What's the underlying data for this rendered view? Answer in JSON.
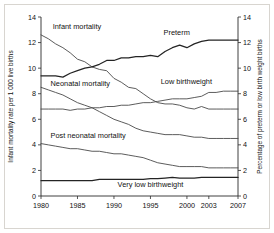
{
  "chart_data": {
    "type": "line",
    "title": "",
    "xlabel": "",
    "ylabel": "Infant mortality rate per 1 000 live births",
    "y2label": "Percentage of preterm or low birth weight births",
    "xlim": [
      1980,
      2007
    ],
    "ylim": [
      0,
      14
    ],
    "y2lim": [
      0,
      14
    ],
    "grid": false,
    "legend_position": "inline-annotations",
    "xticks": [
      "1980",
      "1985",
      "1990",
      "1995",
      "2000",
      "2003",
      "2007"
    ],
    "xtick_values": [
      1980,
      1985,
      1990,
      1995,
      2000,
      2003,
      2007
    ],
    "yticks": [
      "0",
      "2",
      "4",
      "6",
      "8",
      "10",
      "12",
      "14"
    ],
    "ytick_values": [
      0,
      2,
      4,
      6,
      8,
      10,
      12,
      14
    ],
    "y2ticks": [
      "0",
      "2",
      "4",
      "6",
      "8",
      "10",
      "12",
      "14"
    ],
    "y2tick_values": [
      0,
      2,
      4,
      6,
      8,
      10,
      12,
      14
    ],
    "x": [
      1980,
      1981,
      1982,
      1983,
      1984,
      1985,
      1986,
      1987,
      1988,
      1989,
      1990,
      1991,
      1992,
      1993,
      1994,
      1995,
      1996,
      1997,
      1998,
      1999,
      2000,
      2001,
      2002,
      2003,
      2004,
      2005,
      2006,
      2007
    ],
    "series": [
      {
        "name": "Infant mortality",
        "axis": "left",
        "label": "Infant mortality",
        "color": "#4a4a4a",
        "values": [
          12.6,
          12.3,
          11.9,
          11.6,
          11.2,
          10.7,
          10.5,
          10.1,
          9.9,
          9.8,
          9.2,
          8.9,
          8.5,
          8.4,
          8.0,
          7.6,
          7.3,
          7.2,
          7.2,
          7.1,
          6.9,
          6.8,
          7.0,
          6.8,
          6.8,
          6.8,
          6.8,
          6.8
        ]
      },
      {
        "name": "Neonatal mortality",
        "axis": "left",
        "label": "Neonatal mortality",
        "color": "#4a4a4a",
        "values": [
          8.5,
          8.3,
          8.1,
          7.9,
          7.6,
          7.3,
          7.1,
          6.9,
          6.6,
          6.3,
          6.0,
          5.8,
          5.6,
          5.3,
          5.1,
          5.0,
          4.9,
          4.8,
          4.8,
          4.8,
          4.7,
          4.6,
          4.6,
          4.5,
          4.5,
          4.5,
          4.5,
          4.5
        ]
      },
      {
        "name": "Post neonatal mortality",
        "axis": "left",
        "label": "Post neonatal mortality",
        "color": "#4a4a4a",
        "values": [
          4.1,
          4.0,
          3.9,
          3.8,
          3.7,
          3.7,
          3.6,
          3.5,
          3.5,
          3.4,
          3.3,
          3.3,
          3.2,
          3.1,
          3.0,
          2.8,
          2.6,
          2.5,
          2.4,
          2.3,
          2.3,
          2.3,
          2.3,
          2.2,
          2.2,
          2.2,
          2.2,
          2.2
        ]
      },
      {
        "name": "Preterm",
        "axis": "right",
        "label": "Preterm",
        "color": "#242424",
        "values": [
          9.4,
          9.4,
          9.4,
          9.3,
          9.6,
          9.8,
          10.0,
          10.1,
          10.3,
          10.6,
          10.6,
          10.8,
          10.8,
          10.9,
          10.9,
          11.0,
          10.9,
          11.3,
          11.6,
          11.8,
          11.6,
          11.9,
          12.1,
          12.2,
          12.2,
          12.2,
          12.2,
          12.2
        ]
      },
      {
        "name": "Low birthweight",
        "axis": "right",
        "label": "Low birthweight",
        "color": "#4a4a4a",
        "values": [
          6.8,
          6.8,
          6.8,
          6.8,
          6.7,
          6.8,
          6.8,
          6.9,
          6.9,
          7.0,
          7.0,
          7.1,
          7.1,
          7.2,
          7.3,
          7.3,
          7.4,
          7.5,
          7.6,
          7.6,
          7.6,
          7.7,
          7.8,
          8.1,
          8.1,
          8.2,
          8.2,
          8.2
        ]
      },
      {
        "name": "Very low birthweight",
        "axis": "right",
        "label": "Very low birthweight",
        "color": "#242424",
        "values": [
          1.2,
          1.2,
          1.2,
          1.2,
          1.2,
          1.2,
          1.2,
          1.2,
          1.3,
          1.3,
          1.3,
          1.3,
          1.3,
          1.3,
          1.3,
          1.35,
          1.35,
          1.4,
          1.45,
          1.4,
          1.4,
          1.4,
          1.45,
          1.45,
          1.45,
          1.45,
          1.45,
          1.45
        ]
      }
    ],
    "annotations": [
      {
        "text": "Infant mortality",
        "x": 1981.6,
        "y": 13.1,
        "anchor": "start"
      },
      {
        "text": "Neonatal mortality",
        "x": 1981.3,
        "y": 8.6,
        "anchor": "start"
      },
      {
        "text": "Post neonatal mortality",
        "x": 1981.3,
        "y": 4.55,
        "anchor": "start"
      },
      {
        "text": "Preterm",
        "x": 1996.8,
        "y": 12.6,
        "anchor": "start"
      },
      {
        "text": "Low birthweight",
        "x": 1996.4,
        "y": 8.75,
        "anchor": "start"
      },
      {
        "text": "Very low birthweight",
        "x": 1990.5,
        "y": 0.72,
        "anchor": "start"
      }
    ]
  }
}
